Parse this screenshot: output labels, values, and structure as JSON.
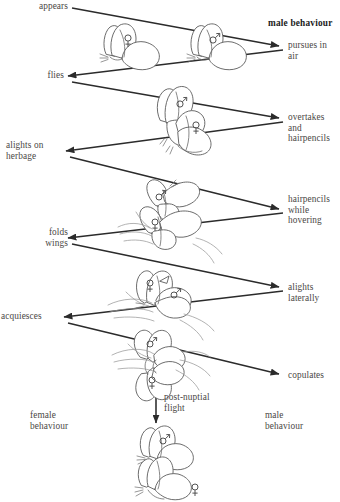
{
  "diagram": {
    "type": "zigzag-flow",
    "columns": {
      "male_header": "male  behaviour",
      "female_footer": "female\nbehaviour",
      "male_footer": "male\nbehaviour"
    },
    "female_steps": [
      {
        "id": "appears",
        "label": "appears"
      },
      {
        "id": "flies",
        "label": "flies"
      },
      {
        "id": "alights-on-herbage",
        "label": "alights on\nherbage"
      },
      {
        "id": "folds-wings",
        "label": "folds\nwings"
      },
      {
        "id": "acquiesces",
        "label": "acquiesces"
      }
    ],
    "male_steps": [
      {
        "id": "pursues-in-air",
        "label": "pursues in\nair"
      },
      {
        "id": "overtakes-and-hairpencils",
        "label": "overtakes\nand\nhairpencils"
      },
      {
        "id": "hairpencils-while-hovering",
        "label": "hairpencils\nwhile\nhovering"
      },
      {
        "id": "alights-laterally",
        "label": "alights\nlaterally"
      },
      {
        "id": "copulates",
        "label": "copulates"
      }
    ],
    "final_step": {
      "id": "post-nuptial-flight",
      "label": "post-nuptial\nflight"
    },
    "symbols": {
      "female": "♀",
      "male": "♂"
    },
    "colors": {
      "ink": "#3a3a3a",
      "line": "#2b2b2b",
      "outline": "#5b5b5b",
      "vegetation": "#9a9a9a",
      "background": "#ffffff"
    },
    "illustrations": [
      {
        "id": "pair-in-flight",
        "sexes": [
          "female",
          "male"
        ]
      },
      {
        "id": "male-overtaking-female",
        "sexes": [
          "male",
          "female"
        ]
      },
      {
        "id": "male-hovering-over-female-on-herbage",
        "sexes": [
          "male",
          "female"
        ]
      },
      {
        "id": "female-wings-folded-male-lateral",
        "sexes": [
          "female",
          "male"
        ]
      },
      {
        "id": "copulating-pair-on-herbage",
        "sexes": [
          "male",
          "female"
        ]
      },
      {
        "id": "post-nuptial-flight-pair",
        "sexes": [
          "male",
          "female"
        ]
      }
    ]
  }
}
